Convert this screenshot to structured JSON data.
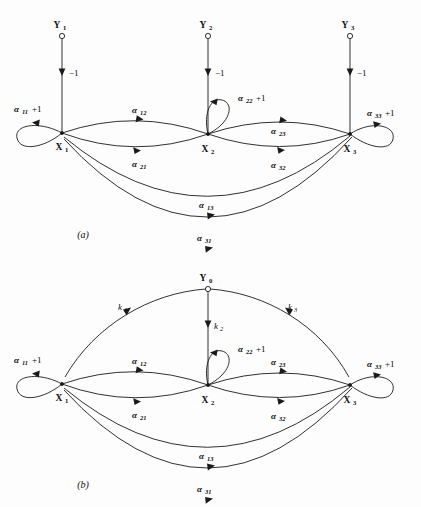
{
  "figure": {
    "background_color": "#fdfdfd",
    "ink_color": "#1a1a1a",
    "panels": [
      {
        "id": "panel-a",
        "caption": "(a)",
        "source_nodes": [
          {
            "id": "Y1",
            "base": "Y",
            "sub": "1"
          },
          {
            "id": "Y2",
            "base": "Y",
            "sub": "2"
          },
          {
            "id": "Y3",
            "base": "Y",
            "sub": "3"
          }
        ],
        "state_nodes": [
          {
            "id": "X1",
            "base": "X",
            "sub": "1"
          },
          {
            "id": "X2",
            "base": "X",
            "sub": "2"
          },
          {
            "id": "X3",
            "base": "X",
            "sub": "3"
          }
        ],
        "input_edges": [
          {
            "from": "Y1",
            "to": "X1",
            "label": "−1"
          },
          {
            "from": "Y2",
            "to": "X2",
            "label": "−1"
          },
          {
            "from": "Y3",
            "to": "X3",
            "label": "−1"
          }
        ],
        "self_loops": [
          {
            "node": "X1",
            "base": "α",
            "sub": "11",
            "tail": "+1"
          },
          {
            "node": "X2",
            "base": "α",
            "sub": "22",
            "tail": "+1"
          },
          {
            "node": "X3",
            "base": "α",
            "sub": "33",
            "tail": "+1"
          }
        ],
        "edges": [
          {
            "from": "X1",
            "to": "X2",
            "base": "α",
            "sub": "12",
            "side": "upper"
          },
          {
            "from": "X1",
            "to": "X2",
            "base": "α",
            "sub": "21",
            "side": "lower"
          },
          {
            "from": "X2",
            "to": "X3",
            "base": "α",
            "sub": "23",
            "side": "upper"
          },
          {
            "from": "X2",
            "to": "X3",
            "base": "α",
            "sub": "32",
            "side": "lower"
          },
          {
            "from": "X1",
            "to": "X3",
            "base": "α",
            "sub": "13",
            "side": "outer-inner"
          },
          {
            "from": "X1",
            "to": "X3",
            "base": "α",
            "sub": "31",
            "side": "outer-outer"
          }
        ]
      },
      {
        "id": "panel-b",
        "caption": "(b)",
        "source_nodes": [
          {
            "id": "Y0",
            "base": "Y",
            "sub": "0"
          }
        ],
        "state_nodes": [
          {
            "id": "X1",
            "base": "X",
            "sub": "1"
          },
          {
            "id": "X2",
            "base": "X",
            "sub": "2"
          },
          {
            "id": "X3",
            "base": "X",
            "sub": "3"
          }
        ],
        "input_edges": [
          {
            "from": "Y0",
            "to": "X1",
            "base": "k",
            "sub": "1"
          },
          {
            "from": "Y0",
            "to": "X2",
            "base": "k",
            "sub": "2"
          },
          {
            "from": "Y0",
            "to": "X3",
            "base": "k",
            "sub": "3"
          }
        ],
        "self_loops": [
          {
            "node": "X1",
            "base": "α",
            "sub": "11",
            "tail": "+1"
          },
          {
            "node": "X2",
            "base": "α",
            "sub": "22",
            "tail": "+1"
          },
          {
            "node": "X3",
            "base": "α",
            "sub": "33",
            "tail": "+1"
          }
        ],
        "edges": [
          {
            "from": "X1",
            "to": "X2",
            "base": "α",
            "sub": "12",
            "side": "upper"
          },
          {
            "from": "X1",
            "to": "X2",
            "base": "α",
            "sub": "21",
            "side": "lower"
          },
          {
            "from": "X2",
            "to": "X3",
            "base": "α",
            "sub": "23",
            "side": "upper"
          },
          {
            "from": "X2",
            "to": "X3",
            "base": "α",
            "sub": "32",
            "side": "lower"
          },
          {
            "from": "X1",
            "to": "X3",
            "base": "α",
            "sub": "13",
            "side": "outer-inner"
          },
          {
            "from": "X1",
            "to": "X3",
            "base": "α",
            "sub": "31",
            "side": "outer-outer"
          }
        ]
      }
    ]
  },
  "labels": {
    "a": {
      "caption": "(a)",
      "Y1": "Y",
      "Y1_sub": "1",
      "Y2": "Y",
      "Y2_sub": "2",
      "Y3": "Y",
      "Y3_sub": "3",
      "X1": "X",
      "X1_sub": "1",
      "X2": "X",
      "X2_sub": "2",
      "X3": "X",
      "X3_sub": "3",
      "in1": "−1",
      "in2": "−1",
      "in3": "−1",
      "a11": "α",
      "a11_sub": "11",
      "a11_tail": "+1",
      "a22": "α",
      "a22_sub": "22",
      "a22_tail": "+1",
      "a33": "α",
      "a33_sub": "33",
      "a33_tail": "+1",
      "a12": "α",
      "a12_sub": "12",
      "a21": "α",
      "a21_sub": "21",
      "a23": "α",
      "a23_sub": "23",
      "a32": "α",
      "a32_sub": "32",
      "a13": "α",
      "a13_sub": "13",
      "a31": "α",
      "a31_sub": "31"
    },
    "b": {
      "caption": "(b)",
      "Y0": "Y",
      "Y0_sub": "0",
      "X1": "X",
      "X1_sub": "1",
      "X2": "X",
      "X2_sub": "2",
      "X3": "X",
      "X3_sub": "3",
      "k1": "k",
      "k1_sub": "1",
      "k2": "k",
      "k2_sub": "2",
      "k3": "k",
      "k3_sub": "3",
      "a11": "α",
      "a11_sub": "11",
      "a11_tail": "+1",
      "a22": "α",
      "a22_sub": "22",
      "a22_tail": "+1",
      "a33": "α",
      "a33_sub": "33",
      "a33_tail": "+1",
      "a12": "α",
      "a12_sub": "12",
      "a21": "α",
      "a21_sub": "21",
      "a23": "α",
      "a23_sub": "23",
      "a32": "α",
      "a32_sub": "32",
      "a13": "α",
      "a13_sub": "13",
      "a31": "α",
      "a31_sub": "31"
    }
  }
}
